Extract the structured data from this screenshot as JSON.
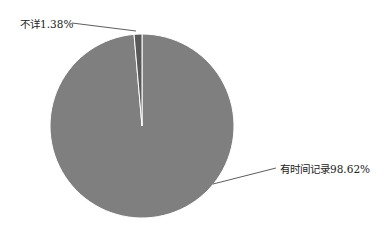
{
  "chart_data": {
    "type": "pie",
    "title": "",
    "categories": [
      "有时间记录",
      "不详"
    ],
    "values": [
      98.62,
      1.38
    ],
    "unit": "%",
    "labels": [
      "有时间记录98.62%",
      "不详1.38%"
    ],
    "colors": [
      "#7f7f7f",
      "#595959"
    ],
    "legend": "none",
    "start_angle_deg": 0,
    "direction": "clockwise"
  },
  "labels": {
    "unknown": "不详1.38%",
    "recorded": "有时间记录98.62%"
  }
}
